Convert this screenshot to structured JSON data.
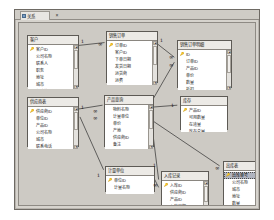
{
  "window": {
    "tab_label": "关系",
    "tab_icon": "relationships-icon",
    "tab_close": "×"
  },
  "canvas": {
    "background_color": "#cdcac4"
  },
  "tables": [
    {
      "id": "customers",
      "title": "客户",
      "x": 8,
      "y": 12,
      "w": 52,
      "h": 52,
      "scrollbar": true,
      "fields": [
        {
          "name": "客户ID",
          "pk": true,
          "selected": false
        },
        {
          "name": "公司名称",
          "pk": false,
          "selected": false
        },
        {
          "name": "联系人",
          "pk": false,
          "selected": false
        },
        {
          "name": "职务",
          "pk": false,
          "selected": false
        },
        {
          "name": "地址",
          "pk": false,
          "selected": false
        },
        {
          "name": "城市",
          "pk": false,
          "selected": false
        },
        {
          "name": "邮政编码",
          "pk": false,
          "selected": false
        }
      ]
    },
    {
      "id": "orders",
      "title": "销售订单",
      "x": 87,
      "y": 8,
      "w": 52,
      "h": 52,
      "scrollbar": true,
      "fields": [
        {
          "name": "订单ID",
          "pk": true,
          "selected": false
        },
        {
          "name": "客户ID",
          "pk": false,
          "selected": false
        },
        {
          "name": "下单日期",
          "pk": false,
          "selected": false
        },
        {
          "name": "发货日期",
          "pk": false,
          "selected": false
        },
        {
          "name": "运货商",
          "pk": false,
          "selected": false
        },
        {
          "name": "运费",
          "pk": false,
          "selected": false
        }
      ]
    },
    {
      "id": "order_details",
      "title": "销售订单明细",
      "x": 158,
      "y": 17,
      "w": 55,
      "h": 48,
      "scrollbar": true,
      "fields": [
        {
          "name": "ID",
          "pk": true,
          "selected": false
        },
        {
          "name": "订单ID",
          "pk": false,
          "selected": false
        },
        {
          "name": "产品ID",
          "pk": false,
          "selected": false
        },
        {
          "name": "单价",
          "pk": false,
          "selected": false
        },
        {
          "name": "数量",
          "pk": false,
          "selected": false
        },
        {
          "name": "折扣",
          "pk": false,
          "selected": false
        }
      ]
    },
    {
      "id": "suppliers",
      "title": "供应商表",
      "x": 8,
      "y": 74,
      "w": 52,
      "h": 50,
      "scrollbar": true,
      "fields": [
        {
          "name": "供应商ID",
          "pk": true,
          "selected": false
        },
        {
          "name": "单位ID",
          "pk": false,
          "selected": false
        },
        {
          "name": "产品ID",
          "pk": false,
          "selected": false
        },
        {
          "name": "公司名称",
          "pk": false,
          "selected": false
        },
        {
          "name": "城市",
          "pk": false,
          "selected": false
        },
        {
          "name": "联系电话",
          "pk": false,
          "selected": false
        }
      ]
    },
    {
      "id": "products",
      "title": "产品查询",
      "x": 85,
      "y": 72,
      "w": 50,
      "h": 52,
      "scrollbar": true,
      "fields": [
        {
          "name": "物料名称",
          "pk": false,
          "selected": false
        },
        {
          "name": "计量单位",
          "pk": false,
          "selected": false
        },
        {
          "name": "单价",
          "pk": false,
          "selected": false
        },
        {
          "name": "产地",
          "pk": false,
          "selected": false
        },
        {
          "name": "供应商ID",
          "pk": false,
          "selected": false
        },
        {
          "name": "备注",
          "pk": false,
          "selected": false
        }
      ]
    },
    {
      "id": "inventory",
      "title": "库存",
      "x": 161,
      "y": 73,
      "w": 48,
      "h": 34,
      "scrollbar": false,
      "fields": [
        {
          "name": "产品ID",
          "pk": true,
          "selected": false
        },
        {
          "name": "可用数量",
          "pk": false,
          "selected": false
        },
        {
          "name": "在途量",
          "pk": false,
          "selected": false
        },
        {
          "name": "库存总量",
          "pk": false,
          "selected": false
        }
      ]
    },
    {
      "id": "units",
      "title": "计量单位",
      "x": 86,
      "y": 143,
      "w": 50,
      "h": 26,
      "scrollbar": false,
      "fields": [
        {
          "name": "单位ID",
          "pk": true,
          "selected": false
        },
        {
          "name": "计量名称",
          "pk": false,
          "selected": false
        }
      ]
    },
    {
      "id": "employees",
      "title": "入库记录",
      "x": 142,
      "y": 148,
      "w": 48,
      "h": 44,
      "scrollbar": true,
      "fields": [
        {
          "name": "入库ID",
          "pk": true,
          "selected": false
        },
        {
          "name": "供应商ID",
          "pk": false,
          "selected": false
        },
        {
          "name": "产品ID",
          "pk": false,
          "selected": false
        },
        {
          "name": "入库日期",
          "pk": false,
          "selected": false
        },
        {
          "name": "数量",
          "pk": false,
          "selected": false
        },
        {
          "name": "入库批号",
          "pk": false,
          "selected": false
        }
      ]
    },
    {
      "id": "shippers",
      "title": "出库表",
      "x": 204,
      "y": 138,
      "w": 50,
      "h": 50,
      "scrollbar": true,
      "fields": [
        {
          "name": "出库单号",
          "pk": true,
          "selected": true
        },
        {
          "name": "公司名称",
          "pk": false,
          "selected": false
        },
        {
          "name": "城市",
          "pk": false,
          "selected": false
        },
        {
          "name": "地址",
          "pk": false,
          "selected": false
        },
        {
          "name": "数量",
          "pk": false,
          "selected": false
        },
        {
          "name": "出库日期",
          "pk": false,
          "selected": false
        }
      ]
    }
  ],
  "relationships": [
    {
      "id": "rel-customers-orders",
      "from": "客户",
      "to": "销售订单",
      "one": "1",
      "many": "∞"
    },
    {
      "id": "rel-orders-details",
      "from": "销售订单",
      "to": "销售订单明细",
      "one": "1",
      "many": "∞"
    },
    {
      "id": "rel-products-details",
      "from": "产品查询",
      "to": "销售订单明细",
      "one": "1",
      "many": "∞"
    },
    {
      "id": "rel-products-inventory",
      "from": "产品查询",
      "to": "库存",
      "one": "1",
      "many": "∞"
    },
    {
      "id": "rel-suppliers-products",
      "from": "供应商表",
      "to": "产品查询",
      "one": "1",
      "many": "∞"
    },
    {
      "id": "rel-products-units",
      "from": "产品查询",
      "to": "计量单位",
      "one": "1",
      "many": "∞"
    },
    {
      "id": "rel-products-inbound",
      "from": "产品查询",
      "to": "入库记录",
      "one": "1",
      "many": "∞"
    },
    {
      "id": "rel-inbound-outbound",
      "from": "入库记录",
      "to": "出库表",
      "one": "1",
      "many": "∞"
    }
  ]
}
